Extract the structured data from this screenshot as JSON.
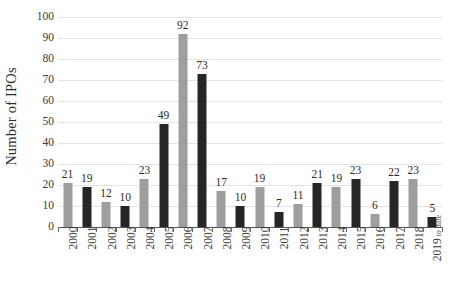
{
  "chart_data": {
    "type": "bar",
    "title": "",
    "xlabel": "",
    "ylabel": "Number of IPOs",
    "ylim": [
      0,
      100
    ],
    "ytick_step": 10,
    "yticks": [
      0,
      10,
      20,
      30,
      40,
      50,
      60,
      70,
      80,
      90,
      100
    ],
    "grid": true,
    "legend": "none",
    "categories": [
      "2000",
      "2001",
      "2002",
      "2003",
      "2004",
      "2005",
      "2006",
      "2007",
      "2008",
      "2009",
      "2010",
      "2011",
      "2012",
      "2013",
      "2014",
      "2015",
      "2016",
      "2017",
      "2018",
      "2019 to date"
    ],
    "category_sublabels": [
      "",
      "",
      "",
      "",
      "",
      "",
      "",
      "",
      "",
      "",
      "",
      "",
      "",
      "",
      "",
      "",
      "",
      "",
      "",
      "to date"
    ],
    "category_mainlabels": [
      "2000",
      "2001",
      "2002",
      "2003",
      "2004",
      "2005",
      "2006",
      "2007",
      "2008",
      "2009",
      "2010",
      "2011",
      "2012",
      "2013",
      "2014",
      "2015",
      "2016",
      "2017",
      "2018",
      "2019"
    ],
    "values": [
      21,
      19,
      12,
      10,
      23,
      49,
      92,
      73,
      17,
      10,
      19,
      7,
      11,
      21,
      19,
      23,
      6,
      22,
      23,
      5
    ],
    "bar_colors": [
      "#9e9e9e",
      "#262626",
      "#9e9e9e",
      "#262626",
      "#9e9e9e",
      "#262626",
      "#9e9e9e",
      "#262626",
      "#9e9e9e",
      "#262626",
      "#9e9e9e",
      "#262626",
      "#9e9e9e",
      "#262626",
      "#9e9e9e",
      "#262626",
      "#9e9e9e",
      "#262626",
      "#9e9e9e",
      "#262626"
    ],
    "data_labels": [
      "21",
      "19",
      "12",
      "10",
      "23",
      "49",
      "92",
      "73",
      "17",
      "10",
      "19",
      "7",
      "11",
      "21",
      "19",
      "23",
      "6",
      "22",
      "23",
      "5"
    ],
    "colors": {
      "bar_light": "#9e9e9e",
      "bar_dark": "#262626",
      "gridline": "#e3e3e3",
      "axis": "#555555",
      "text": "#2b2b2b",
      "background": "#ffffff"
    }
  },
  "axis": {
    "y_title": "Number of IPOs"
  }
}
